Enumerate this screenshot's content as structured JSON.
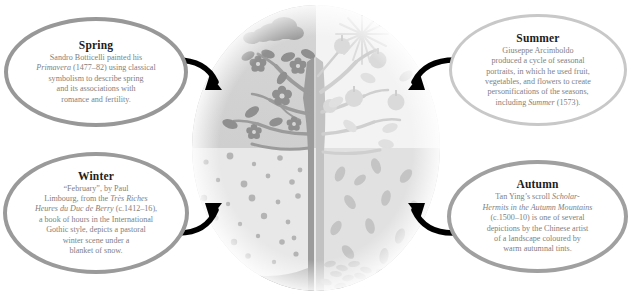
{
  "diagram": {
    "name": "four-seasons-art-infographic",
    "center": {
      "name": "seasonal-tree-circle",
      "quadrants": [
        {
          "key": "spring",
          "label": "Spring",
          "position": "top-left",
          "fill": "#d2d2d2",
          "motifs": [
            "clouds",
            "blossoms",
            "leaves"
          ]
        },
        {
          "key": "summer",
          "label": "Summer",
          "position": "top-right",
          "fill": "#f2f2f2",
          "motifs": [
            "sun",
            "fruit",
            "leaves"
          ]
        },
        {
          "key": "winter",
          "label": "Winter",
          "position": "bottom-left",
          "fill": "#e6e6e6",
          "motifs": [
            "snow",
            "snow-drift",
            "bare-branches"
          ]
        },
        {
          "key": "autumn",
          "label": "Autumn",
          "position": "bottom-right",
          "fill": "#e0e0e0",
          "motifs": [
            "falling-leaves",
            "leaf-pile"
          ]
        }
      ],
      "trunk_color": "#9d9d9d"
    }
  },
  "callouts": {
    "spring": {
      "title": "Spring",
      "lines": [
        {
          "text": "Sandro Botticelli painted his"
        },
        {
          "text": "Primavera",
          "italic": true,
          "tail": " (1477–82) using classical"
        },
        {
          "text": "symbolism to describe spring"
        },
        {
          "text": "and its associations with"
        },
        {
          "text": "romance and fertility."
        }
      ],
      "border_color": "#989898"
    },
    "summer": {
      "title": "Summer",
      "lines": [
        {
          "text": "Giuseppe Arcimboldo"
        },
        {
          "text": "produced a cycle of seasonal"
        },
        {
          "text": "portraits, in which he used fruit,"
        },
        {
          "text": "vegetables, and flowers to create"
        },
        {
          "text": "personifications of the seasons,"
        },
        {
          "text": "including ",
          "italic_tail": "Summer",
          "tail": " (1573)."
        }
      ],
      "border_color": "#c8c8c8"
    },
    "winter": {
      "title": "Winter",
      "lines": [
        {
          "text": "“February”, by Paul"
        },
        {
          "text": "Limbourg, from the ",
          "italic_tail": "Très Riches"
        },
        {
          "text": "Heures du Duc de Berry",
          "italic": true,
          "tail": " (c.1412–16),"
        },
        {
          "text": "a book of hours in the International"
        },
        {
          "text": "Gothic style, depicts a pastoral"
        },
        {
          "text": "winter scene under a"
        },
        {
          "text": "blanket of snow."
        }
      ],
      "border_color": "#9a9a9a"
    },
    "autumn": {
      "title": "Autumn",
      "lines": [
        {
          "text": "Tan Ying’s scroll ",
          "italic_tail": "Scholar-"
        },
        {
          "text": "Hermits in the Autumn Mountains",
          "italic": true
        },
        {
          "text": "(c.1500–10) is one of several"
        },
        {
          "text": "depictions by the Chinese artist"
        },
        {
          "text": "of a landscape coloured by"
        },
        {
          "text": "warm autumnal tints."
        }
      ],
      "border_color": "#a0a0a0"
    }
  },
  "arrows": [
    {
      "name": "arrow-spring-to-circle",
      "from": "spring-bubble",
      "to": "spring-quadrant",
      "color": "#000000"
    },
    {
      "name": "arrow-summer-to-circle",
      "from": "summer-bubble",
      "to": "summer-quadrant",
      "color": "#000000"
    },
    {
      "name": "arrow-winter-to-circle",
      "from": "winter-bubble",
      "to": "winter-quadrant",
      "color": "#000000"
    },
    {
      "name": "arrow-autumn-to-circle",
      "from": "autumn-bubble",
      "to": "autumn-quadrant",
      "color": "#000000"
    }
  ]
}
